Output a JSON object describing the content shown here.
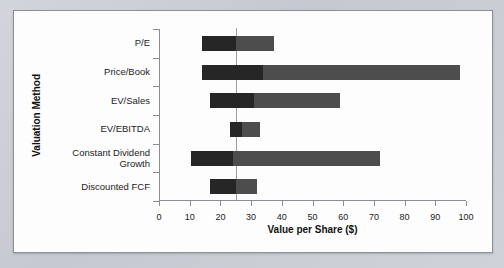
{
  "figure": {
    "background_color": "#fdfdfd",
    "frame_color": "#8e9099",
    "page_background": "#c9ccd4"
  },
  "chart_data": {
    "type": "bar",
    "orientation": "horizontal",
    "subtype": "floating-range-bar (football field valuation)",
    "title": "",
    "xlabel": "Value per Share ($)",
    "ylabel": "Valuation Method",
    "xlim": [
      0,
      100
    ],
    "xticks": [
      0,
      10,
      20,
      30,
      40,
      50,
      60,
      70,
      80,
      90,
      100
    ],
    "xtick_labels": [
      "0",
      "10",
      "20",
      "30",
      "40",
      "50",
      "60",
      "70",
      "80",
      "90",
      "100"
    ],
    "grid": false,
    "legend": "none",
    "reference_line": {
      "value": 25,
      "label": "",
      "color": "#9a9da3"
    },
    "colors": {
      "segment_low": "#262626",
      "segment_high": "#4d4d4d"
    },
    "categories": [
      "P/E",
      "Price/Book",
      "EV/Sales",
      "EV/EBITDA",
      "Constant Dividend\nGrowth",
      "Discounted FCF"
    ],
    "bars": [
      {
        "category": "P/E",
        "low": 14.0,
        "split": 25.0,
        "high": 37.5
      },
      {
        "category": "Price/Book",
        "low": 14.0,
        "split": 34.0,
        "high": 98.0
      },
      {
        "category": "EV/Sales",
        "low": 16.5,
        "split": 31.0,
        "high": 59.0
      },
      {
        "category": "EV/EBITDA",
        "low": 23.0,
        "split": 27.0,
        "high": 33.0
      },
      {
        "category": "Constant Dividend\nGrowth",
        "low": 10.5,
        "split": 24.0,
        "high": 72.0
      },
      {
        "category": "Discounted FCF",
        "low": 16.5,
        "split": 25.0,
        "high": 32.0
      }
    ]
  }
}
